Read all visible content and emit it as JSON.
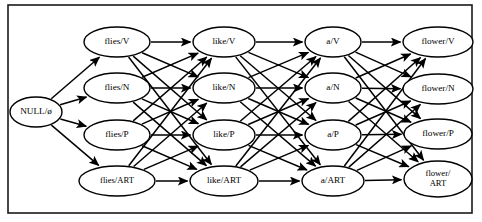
{
  "figure": {
    "border_color": "#1a1a1a",
    "background_color": "#ffffff",
    "node_fill": "#ffffff",
    "node_stroke": "#000000",
    "edge_color": "#000000"
  },
  "columns": [
    {
      "id": "col-null",
      "word": "NULL",
      "cx": 36,
      "rx": 26,
      "ry": 15,
      "nodes": [
        {
          "id": "null-start",
          "label": "NULL/ø",
          "tag": "ø",
          "cy": 112,
          "rx": 26,
          "ry": 15,
          "lines": [
            "NULL/ø"
          ]
        }
      ]
    },
    {
      "id": "col-flies",
      "word": "flies",
      "cx": 117,
      "rx": 33,
      "ry": 15,
      "nodes": [
        {
          "id": "flies-V",
          "label": "flies/V",
          "tag": "V",
          "cy": 42,
          "rx": 33,
          "ry": 15,
          "lines": [
            "flies/V"
          ]
        },
        {
          "id": "flies-N",
          "label": "flies/N",
          "tag": "N",
          "cy": 88,
          "rx": 33,
          "ry": 15,
          "lines": [
            "flies/N"
          ]
        },
        {
          "id": "flies-P",
          "label": "flies/P",
          "tag": "P",
          "cy": 135,
          "rx": 33,
          "ry": 15,
          "lines": [
            "flies/P"
          ]
        },
        {
          "id": "flies-ART",
          "label": "flies/ART",
          "tag": "ART",
          "cy": 181,
          "rx": 38,
          "ry": 15,
          "lines": [
            "flies/ART"
          ]
        }
      ]
    },
    {
      "id": "col-like",
      "word": "like",
      "cx": 224,
      "rx": 31,
      "ry": 15,
      "nodes": [
        {
          "id": "like-V",
          "label": "like/V",
          "tag": "V",
          "cy": 42,
          "rx": 31,
          "ry": 15,
          "lines": [
            "like/V"
          ]
        },
        {
          "id": "like-N",
          "label": "like/N",
          "tag": "N",
          "cy": 88,
          "rx": 31,
          "ry": 15,
          "lines": [
            "like/N"
          ]
        },
        {
          "id": "like-P",
          "label": "like/P",
          "tag": "P",
          "cy": 135,
          "rx": 31,
          "ry": 15,
          "lines": [
            "like/P"
          ]
        },
        {
          "id": "like-ART",
          "label": "like/ART",
          "tag": "ART",
          "cy": 181,
          "rx": 34,
          "ry": 15,
          "lines": [
            "like/ART"
          ]
        }
      ]
    },
    {
      "id": "col-a",
      "word": "a",
      "cx": 333,
      "rx": 28,
      "ry": 15,
      "nodes": [
        {
          "id": "a-V",
          "label": "a/V",
          "tag": "V",
          "cy": 42,
          "rx": 28,
          "ry": 15,
          "lines": [
            "a/V"
          ]
        },
        {
          "id": "a-N",
          "label": "a/N",
          "tag": "N",
          "cy": 88,
          "rx": 28,
          "ry": 15,
          "lines": [
            "a/N"
          ]
        },
        {
          "id": "a-P",
          "label": "a/P",
          "tag": "P",
          "cy": 135,
          "rx": 28,
          "ry": 15,
          "lines": [
            "a/P"
          ]
        },
        {
          "id": "a-ART",
          "label": "a/ART",
          "tag": "ART",
          "cy": 181,
          "rx": 31,
          "ry": 15,
          "lines": [
            "a/ART"
          ]
        }
      ]
    },
    {
      "id": "col-flower",
      "word": "flower",
      "cx": 438,
      "rx": 35,
      "ry": 15,
      "nodes": [
        {
          "id": "flower-V",
          "label": "flower/V",
          "tag": "V",
          "cy": 42,
          "rx": 35,
          "ry": 15,
          "lines": [
            "flower/V"
          ]
        },
        {
          "id": "flower-N",
          "label": "flower/N",
          "tag": "N",
          "cy": 89,
          "rx": 35,
          "ry": 15,
          "lines": [
            "flower/N"
          ]
        },
        {
          "id": "flower-P",
          "label": "flower/P",
          "tag": "P",
          "cy": 134,
          "rx": 34,
          "ry": 15,
          "lines": [
            "flower/P"
          ]
        },
        {
          "id": "flower-ART",
          "label": "flower/ART",
          "tag": "ART",
          "cy": 179,
          "rx": 34,
          "ry": 18,
          "lines": [
            "flower/",
            "ART"
          ]
        }
      ]
    }
  ],
  "edges": {
    "description": "fully connected between adjacent columns",
    "groups": [
      {
        "from": "col-null",
        "to": "col-flies",
        "count": 4
      },
      {
        "from": "col-flies",
        "to": "col-like",
        "count": 16
      },
      {
        "from": "col-like",
        "to": "col-a",
        "count": 16
      },
      {
        "from": "col-a",
        "to": "col-flower",
        "count": 16
      }
    ]
  },
  "frame": {
    "x": 8,
    "y": 5,
    "width": 464,
    "height": 208
  }
}
